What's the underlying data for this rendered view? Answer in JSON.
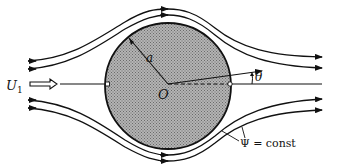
{
  "figure": {
    "labels": {
      "freestream_symbol": "U",
      "freestream_subscript": "1",
      "radius": "a",
      "origin": "O",
      "angle": "θ",
      "streamfunction": "Ψ = const"
    },
    "geometry": {
      "cylinder": {
        "cx": 168,
        "cy": 86,
        "r": 64,
        "fill": "#9a9a9a",
        "stroke": "#111111"
      },
      "centerline_y": 84
    },
    "colors": {
      "line": "#111111",
      "cylinder_fill": "#a0a0a0",
      "background": "#ffffff"
    }
  }
}
